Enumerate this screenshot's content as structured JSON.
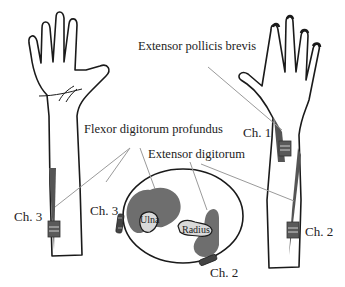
{
  "labels": {
    "extensor_pollicis_brevis": "Extensor pollicis  brevis",
    "flexor_digitorum_profundus": "Flexor digitorum profundus",
    "extensor_digitorum": "Extensor digitorum",
    "ch1": "Ch. 1",
    "ch2_right_arm": "Ch. 2",
    "ch3_left_arm": "Ch. 3",
    "ch3_cross_section": "Ch. 3",
    "ch2_cross_section": "Ch. 2",
    "ulna": "Ulna",
    "radius": "Radius"
  },
  "colors": {
    "outline": "#1a1a1a",
    "muscle": "#6e6e6e",
    "bone_fill": "#d9d9d9",
    "leader_line": "#9a9a9a",
    "electrode": "#5a5a5a",
    "electrode_stripe": "#cfcfcf"
  }
}
